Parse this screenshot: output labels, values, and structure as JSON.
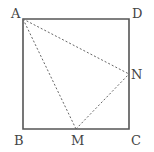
{
  "diagram": {
    "type": "geometry",
    "colors": {
      "stroke": "#555555",
      "dashed": "#666666",
      "label": "#444444",
      "background": "#ffffff"
    },
    "points": {
      "A": {
        "label": "A",
        "x": 23,
        "y": 19
      },
      "D": {
        "label": "D",
        "x": 129,
        "y": 19
      },
      "B": {
        "label": "B",
        "x": 23,
        "y": 129
      },
      "C": {
        "label": "C",
        "x": 129,
        "y": 129
      },
      "N": {
        "label": "N",
        "x": 129,
        "y": 74
      },
      "M": {
        "label": "M",
        "x": 76,
        "y": 129
      }
    },
    "segments": {
      "solid": [
        "AD",
        "DC",
        "CB",
        "BA"
      ],
      "dashed": [
        "AN",
        "AM",
        "MN"
      ]
    }
  }
}
